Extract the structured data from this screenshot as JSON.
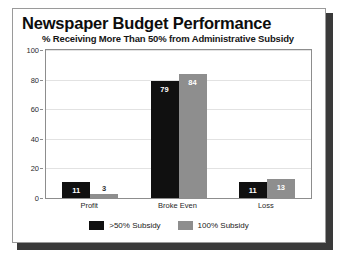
{
  "chart_data": {
    "type": "bar",
    "title": "Newspaper Budget Performance",
    "subtitle": "% Receiving More Than 50% from Administrative Subsidy",
    "xlabel": "",
    "ylabel": "",
    "categories": [
      "Profit",
      "Broke Even",
      "Loss"
    ],
    "series": [
      {
        "name": ">50% Subsidy",
        "color": "#101010",
        "values": [
          11,
          79,
          11
        ]
      },
      {
        "name": "100% Subsidy",
        "color": "#8e8e8e",
        "values": [
          3,
          84,
          13
        ]
      }
    ],
    "ylim": [
      0,
      100
    ],
    "yticks": [
      0,
      20,
      40,
      60,
      80,
      100
    ],
    "ytick_labels": [
      "0",
      "20",
      "40",
      "60",
      "80",
      "100"
    ],
    "grid": true,
    "legend_position": "bottom",
    "value_labels": [
      [
        "11",
        "79",
        "11"
      ],
      [
        "3",
        "84",
        "13"
      ]
    ]
  }
}
